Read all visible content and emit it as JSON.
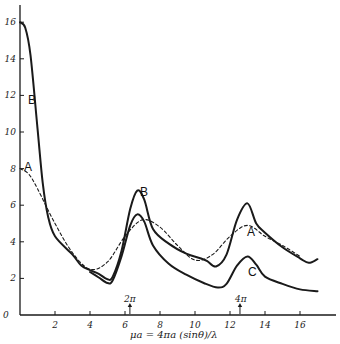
{
  "chart_data": {
    "type": "line",
    "title": "",
    "xlabel": "μa = 4πa (sinθ)/λ",
    "ylabel": "",
    "xlim": [
      0,
      17.5
    ],
    "ylim": [
      0,
      16.5
    ],
    "x_ticks": [
      2,
      4,
      6,
      8,
      10,
      12,
      14,
      16
    ],
    "y_ticks": [
      0,
      2,
      4,
      6,
      8,
      10,
      12,
      14,
      16
    ],
    "grid": false,
    "legend": "inline curve labels",
    "annotations": [
      {
        "text": "2π",
        "x": 6.28,
        "arrow": "up"
      },
      {
        "text": "4π",
        "x": 12.57,
        "arrow": "up"
      }
    ],
    "series": [
      {
        "name": "B",
        "style": "solid",
        "points": [
          [
            0,
            16
          ],
          [
            0.3,
            15.7
          ],
          [
            0.6,
            14.2
          ],
          [
            1,
            10.2
          ],
          [
            1.3,
            7.2
          ],
          [
            1.6,
            5.4
          ],
          [
            2,
            4.3
          ],
          [
            3,
            3.3
          ],
          [
            3.5,
            2.7
          ],
          [
            4,
            2.45
          ],
          [
            4.5,
            2.25
          ],
          [
            5,
            1.95
          ],
          [
            5.3,
            2.1
          ],
          [
            5.8,
            3.5
          ],
          [
            6.3,
            5.8
          ],
          [
            6.7,
            6.8
          ],
          [
            7.1,
            6.3
          ],
          [
            7.6,
            4.7
          ],
          [
            8.5,
            3.9
          ],
          [
            9.5,
            3.35
          ],
          [
            10.3,
            3.1
          ],
          [
            10.7,
            2.95
          ],
          [
            11.2,
            2.65
          ],
          [
            11.8,
            3.3
          ],
          [
            12.4,
            5.2
          ],
          [
            13,
            6.1
          ],
          [
            13.5,
            5.0
          ],
          [
            14,
            4.5
          ],
          [
            15,
            3.7
          ],
          [
            16,
            3.1
          ],
          [
            16.5,
            2.85
          ],
          [
            17,
            3.05
          ]
        ]
      },
      {
        "name": "C",
        "style": "solid",
        "points": [
          [
            4,
            2.35
          ],
          [
            4.5,
            2.05
          ],
          [
            5,
            1.75
          ],
          [
            5.3,
            1.9
          ],
          [
            5.8,
            3.2
          ],
          [
            6.3,
            4.9
          ],
          [
            6.7,
            5.5
          ],
          [
            7.1,
            5.1
          ],
          [
            7.6,
            3.8
          ],
          [
            8.5,
            2.8
          ],
          [
            9.5,
            2.2
          ],
          [
            10.5,
            1.75
          ],
          [
            11.3,
            1.5
          ],
          [
            11.8,
            1.7
          ],
          [
            12.4,
            2.7
          ],
          [
            13,
            3.2
          ],
          [
            13.5,
            2.75
          ],
          [
            14,
            2.1
          ],
          [
            15,
            1.7
          ],
          [
            16,
            1.4
          ],
          [
            17,
            1.3
          ]
        ]
      },
      {
        "name": "A",
        "style": "dashed",
        "points": [
          [
            0,
            8
          ],
          [
            0.5,
            7.7
          ],
          [
            1,
            6.9
          ],
          [
            2,
            5.0
          ],
          [
            3,
            3.4
          ],
          [
            4,
            2.5
          ],
          [
            5,
            2.9
          ],
          [
            6,
            4.3
          ],
          [
            7,
            5.2
          ],
          [
            8,
            4.8
          ],
          [
            9,
            3.8
          ],
          [
            10,
            3.0
          ],
          [
            11,
            3.3
          ],
          [
            12,
            4.3
          ],
          [
            13,
            4.9
          ],
          [
            14,
            4.3
          ],
          [
            15,
            3.8
          ],
          [
            16,
            3.2
          ]
        ]
      }
    ]
  },
  "labels": {
    "curve_b_top": "B",
    "curve_b_mid": "B",
    "curve_a_top": "A",
    "curve_a_right": "A",
    "curve_c": "C",
    "ann_2pi": "2π",
    "ann_4pi": "4π",
    "xlabel": "μa = 4πa (sinθ)/λ",
    "y_ticks": [
      "0",
      "2",
      "4",
      "6",
      "8",
      "10",
      "12",
      "14",
      "16"
    ],
    "x_ticks": [
      "2",
      "4",
      "6",
      "8",
      "10",
      "12",
      "14",
      "16"
    ]
  },
  "colors": {
    "ink": "#1a1a1a",
    "background": "#ffffff"
  }
}
